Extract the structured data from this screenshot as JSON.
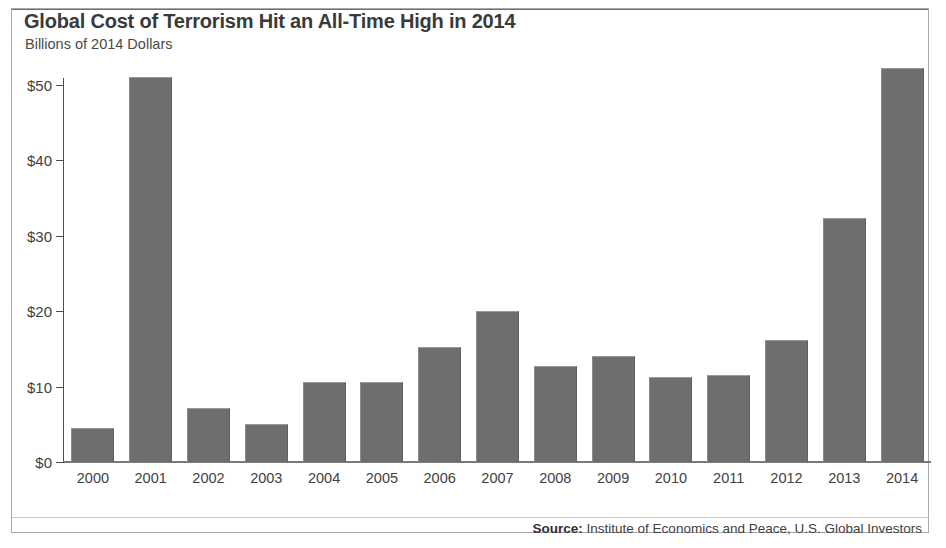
{
  "chart_data": {
    "type": "bar",
    "title": "Global Cost of Terrorism Hit an All-Time High in 2014",
    "subtitle": "Billions of 2014 Dollars",
    "xlabel": "",
    "ylabel": "",
    "ylim": [
      0,
      55
    ],
    "yticks": [
      0,
      10,
      20,
      30,
      40,
      50
    ],
    "ytick_labels": [
      "$0",
      "$10",
      "$20",
      "$30",
      "$40",
      "$50"
    ],
    "grid": false,
    "legend": "none",
    "bar_color": "#6e6e6e",
    "categories": [
      "2000",
      "2001",
      "2002",
      "2003",
      "2004",
      "2005",
      "2006",
      "2007",
      "2008",
      "2009",
      "2010",
      "2011",
      "2012",
      "2013",
      "2014"
    ],
    "values": [
      4.5,
      51.0,
      7.2,
      5.1,
      10.6,
      10.6,
      15.2,
      20.0,
      12.7,
      14.1,
      11.3,
      11.6,
      16.2,
      32.3,
      52.2
    ],
    "source_prefix": "Source:",
    "source_text": " Institute of Economics and Peace, U.S. Global Investors"
  }
}
